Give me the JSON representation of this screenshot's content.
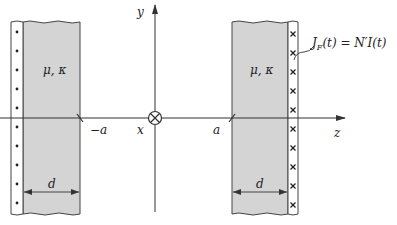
{
  "diagram": {
    "axes": {
      "y_label": "y",
      "z_label": "z",
      "x_label": "x",
      "origin_symbol": "into-page-current"
    },
    "ticks": {
      "neg_a": "−a",
      "pos_a": "a"
    },
    "left_slab": {
      "material_label": "μ, κ",
      "thickness_label": "d",
      "current_direction": "out-of-page",
      "dot_count": 10
    },
    "right_slab": {
      "material_label": "μ, κ",
      "thickness_label": "d",
      "current_direction": "into-page",
      "cross_count": 10
    },
    "current_label": "J_F(t) = N′I(t)",
    "current_label_parts": {
      "J": "J",
      "sub": "F",
      "rest": "(t) = N′I(t)"
    },
    "colors": {
      "slab_fill": "#d4d4d4",
      "line": "#333333",
      "background": "#ffffff"
    }
  }
}
